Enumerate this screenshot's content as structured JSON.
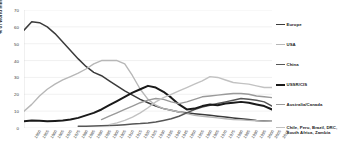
{
  "chart_data": {
    "type": "line",
    "title": "",
    "xlabel": "",
    "ylabel": "% of world mining",
    "ylim": [
      0,
      70
    ],
    "yticks": [
      0,
      10,
      20,
      30,
      40,
      50,
      60,
      70
    ],
    "grid": true,
    "legend_position": "right",
    "categories": [
      "1850",
      "1855",
      "1860",
      "1865",
      "1870",
      "1875",
      "1880",
      "1885",
      "1890",
      "1895",
      "1900",
      "1905",
      "1910",
      "1915",
      "1920",
      "1925",
      "1930",
      "1935",
      "1940",
      "1945",
      "1950",
      "1955",
      "1960",
      "1965",
      "1970",
      "1975",
      "1980",
      "1985",
      "1990",
      "1995",
      "2000",
      "2005",
      "2010"
    ],
    "series": [
      {
        "name": "Europe",
        "color": "#3b3b3b",
        "width": 1.5,
        "values": [
          58,
          63,
          62.5,
          60,
          56,
          51,
          46,
          41,
          36.5,
          33,
          31,
          28,
          25,
          22,
          19.5,
          17,
          15,
          13,
          11.5,
          10.5,
          9.5,
          9,
          8.5,
          8,
          7.5,
          7,
          6.5,
          6,
          5.5,
          5,
          4.5,
          4.2,
          4
        ]
      },
      {
        "name": "USA",
        "color": "#b7b7b7",
        "width": 1.4,
        "values": [
          10,
          14,
          19,
          23,
          26,
          28.5,
          30.5,
          32.5,
          35,
          38,
          40,
          40,
          40,
          38,
          31,
          23,
          17,
          13.5,
          11.5,
          10.5,
          9.5,
          8.5,
          7.5,
          7,
          6.5,
          6,
          5.5,
          5,
          4.8,
          4.5,
          4.3,
          4.1,
          4
        ]
      },
      {
        "name": "China",
        "color": "#565656",
        "width": 1.5,
        "values": [
          null,
          null,
          null,
          null,
          null,
          null,
          null,
          1,
          1.1,
          1.2,
          1.3,
          1.5,
          1.7,
          2,
          2.3,
          2.6,
          3,
          3.6,
          4.5,
          5.5,
          7,
          9,
          11,
          12.5,
          13.5,
          14.5,
          15.5,
          16.5,
          17.5,
          17,
          16.5,
          15.5,
          13
        ]
      },
      {
        "name": "USSR/CIS",
        "color": "#1a1a1a",
        "width": 2.0,
        "values": [
          4,
          4.5,
          4.3,
          4,
          4.2,
          4.5,
          5,
          6,
          7.5,
          9,
          11,
          13.5,
          16,
          18.5,
          21,
          23,
          25,
          24,
          21.5,
          18,
          14,
          11,
          11.5,
          13,
          14,
          13.5,
          14.5,
          15,
          15.5,
          15,
          14,
          13,
          11
        ]
      },
      {
        "name": "Australia/Canada",
        "color": "#9a9a9a",
        "width": 1.4,
        "values": [
          null,
          null,
          null,
          null,
          null,
          null,
          null,
          null,
          null,
          null,
          5,
          7,
          9,
          11,
          13,
          15,
          16.5,
          17.5,
          17,
          15.5,
          14.5,
          15.5,
          17,
          18.5,
          19,
          19.5,
          20,
          20.5,
          20.5,
          20,
          19,
          18.5,
          18
        ]
      },
      {
        "name": "Chile, Peru, Brazil, DRC, South Africa, Zambia",
        "color": "#c2c2c2",
        "width": 1.4,
        "values": [
          null,
          null,
          null,
          null,
          null,
          null,
          null,
          null,
          null,
          null,
          null,
          2,
          3,
          4.5,
          6.5,
          9,
          12,
          15.5,
          18,
          20,
          22,
          24,
          26,
          28,
          30.5,
          30,
          28.5,
          27,
          26.5,
          26,
          25,
          24,
          24
        ]
      }
    ]
  },
  "legend": {
    "items": [
      {
        "label": "Europe"
      },
      {
        "label": "USA"
      },
      {
        "label": "China"
      },
      {
        "label": "USSR/CIS"
      },
      {
        "label": "Australia/Canada"
      },
      {
        "label": "Chile, Peru, Brazil, DRC, South Africa, Zambia"
      }
    ]
  }
}
